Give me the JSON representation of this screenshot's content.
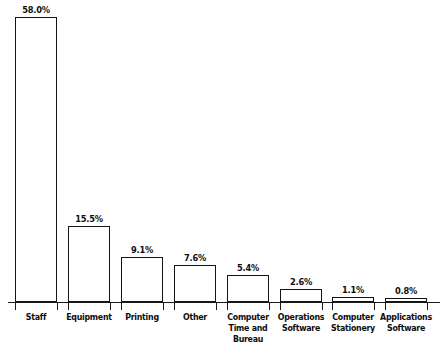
{
  "chart_data": {
    "type": "bar",
    "title": "",
    "subtitle": "",
    "xlabel": "",
    "ylabel": "",
    "ylim": [
      0,
      58.0
    ],
    "grid": false,
    "legend": false,
    "value_suffix": "%",
    "categories": [
      "Staff",
      "Equipment",
      "Printing",
      "Other",
      "Computer Time and Bureau",
      "Operations Software",
      "Computer Stationery",
      "Applications Software"
    ],
    "category_lines": [
      [
        "Staff"
      ],
      [
        "Equipment"
      ],
      [
        "Printing"
      ],
      [
        "Other"
      ],
      [
        "Computer",
        "Time and",
        "Bureau"
      ],
      [
        "Operations",
        "Software"
      ],
      [
        "Computer",
        "Stationery"
      ],
      [
        "Applications",
        "Software"
      ]
    ],
    "values": [
      58.0,
      15.5,
      9.1,
      7.6,
      5.4,
      2.6,
      1.1,
      0.8
    ],
    "value_labels": [
      "58.0%",
      "15.5%",
      "9.1%",
      "7.6%",
      "5.4%",
      "2.6%",
      "1.1%",
      "0.8%"
    ],
    "colors": {
      "bar_fill": "#ffffff",
      "bar_stroke": "#141414",
      "axis": "#1a1a1a",
      "text": "#0d0d0d",
      "background": "#ffffff"
    }
  }
}
